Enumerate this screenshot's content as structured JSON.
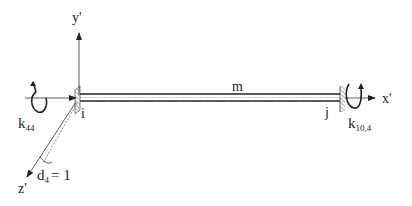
{
  "diagram": {
    "type": "beam-element-stiffness",
    "labels": {
      "y_axis": "y'",
      "x_axis": "x'",
      "z_axis": "z'",
      "member": "m",
      "node_i": "i",
      "node_j": "j",
      "k44_main": "k",
      "k44_sub": "44",
      "k104_main": "k",
      "k104_sub": "10,4",
      "d4_main": "d",
      "d4_sub": "4",
      "d4_eq": "= 1"
    },
    "colors": {
      "line": "#222222",
      "beam_fill": "#ffffff",
      "hatch": "#444444"
    }
  }
}
